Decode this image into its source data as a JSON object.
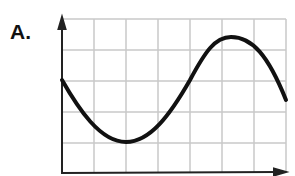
{
  "figure": {
    "label": "A.",
    "grid": {
      "columns": 7,
      "rows": 5,
      "x_lines": [
        62,
        94,
        126,
        158,
        190,
        222,
        254,
        286
      ],
      "y_lines": [
        19,
        50,
        81,
        112,
        143,
        172
      ],
      "color": "#c8c8c8"
    },
    "axes": {
      "color": "#222222",
      "x_arrow": true,
      "y_arrow": true
    },
    "curve": {
      "description": "sinusoidal wave starting mid-left, dipping to a minimum near column 2, rising to a maximum near column 5.3, descending at right edge",
      "color": "#111111",
      "path": "M62,80 C78,108 100,142 126,142 C150,142 170,115 190,80 C205,52 215,37 231,37 C252,37 268,55 286,100"
    }
  }
}
